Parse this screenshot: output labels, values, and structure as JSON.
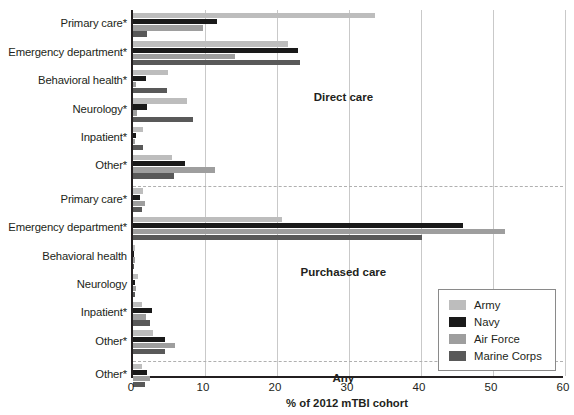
{
  "chart_data": {
    "type": "bar",
    "orientation": "horizontal",
    "title": "",
    "xlabel": "% of 2012 mTBI cohort",
    "ylabel": "",
    "xlim": [
      0,
      60
    ],
    "xticks": [
      0,
      10,
      20,
      30,
      40,
      50,
      60
    ],
    "xtick_labels": [
      "0",
      "10",
      "20",
      "30",
      "40",
      "50",
      "60"
    ],
    "grid": true,
    "grid_axis": "x",
    "legend_position": "lower right",
    "series": [
      {
        "name": "Army",
        "color": "#bdbdbd"
      },
      {
        "name": "Navy",
        "color": "#1a1a1a"
      },
      {
        "name": "Air Force",
        "color": "#9e9e9e"
      },
      {
        "name": "Marine Corps",
        "color": "#595959"
      }
    ],
    "sections": [
      {
        "label": "Direct care",
        "label_x": 29.5,
        "groups": [
          {
            "category": "Primary care*",
            "values": [
              33.6,
              11.7,
              9.7,
              2.0
            ]
          },
          {
            "category": "Emergency department*",
            "values": [
              21.5,
              22.9,
              14.2,
              23.2
            ]
          },
          {
            "category": "Behavioral health*",
            "values": [
              4.9,
              1.8,
              0.4,
              4.7
            ]
          },
          {
            "category": "Neurology*",
            "values": [
              7.5,
              1.9,
              0.5,
              8.3
            ]
          },
          {
            "category": "Inpatient*",
            "values": [
              1.4,
              0.4,
              0.3,
              1.4
            ]
          },
          {
            "category": "Other*",
            "values": [
              5.4,
              7.2,
              11.4,
              5.7
            ]
          }
        ]
      },
      {
        "label": "Purchased care",
        "label_x": 29.5,
        "groups": [
          {
            "category": "Primary care*",
            "values": [
              1.4,
              1.0,
              1.6,
              1.3
            ]
          },
          {
            "category": "Emergency department*",
            "values": [
              20.7,
              45.8,
              51.7,
              40.1
            ]
          },
          {
            "category": "Behavioral health",
            "values": [
              0.3,
              0.2,
              0.3,
              0.2
            ]
          },
          {
            "category": "Neurology",
            "values": [
              0.7,
              0.3,
              0.4,
              0.3
            ]
          },
          {
            "category": "Inpatient*",
            "values": [
              1.3,
              2.6,
              1.8,
              2.4
            ]
          },
          {
            "category": "Other*",
            "values": [
              2.8,
              4.4,
              5.8,
              4.4
            ]
          }
        ]
      },
      {
        "label": "Any",
        "label_x": 29.5,
        "groups": [
          {
            "category": "Other*",
            "values": [
              1.3,
              1.9,
              2.4,
              1.6
            ]
          }
        ]
      }
    ]
  },
  "legend": {
    "items": [
      {
        "label": "Army",
        "color": "#bdbdbd"
      },
      {
        "label": "Navy",
        "color": "#1a1a1a"
      },
      {
        "label": "Air Force",
        "color": "#9e9e9e"
      },
      {
        "label": "Marine Corps",
        "color": "#595959"
      }
    ]
  },
  "axis": {
    "x_title": "% of 2012 mTBI cohort"
  }
}
